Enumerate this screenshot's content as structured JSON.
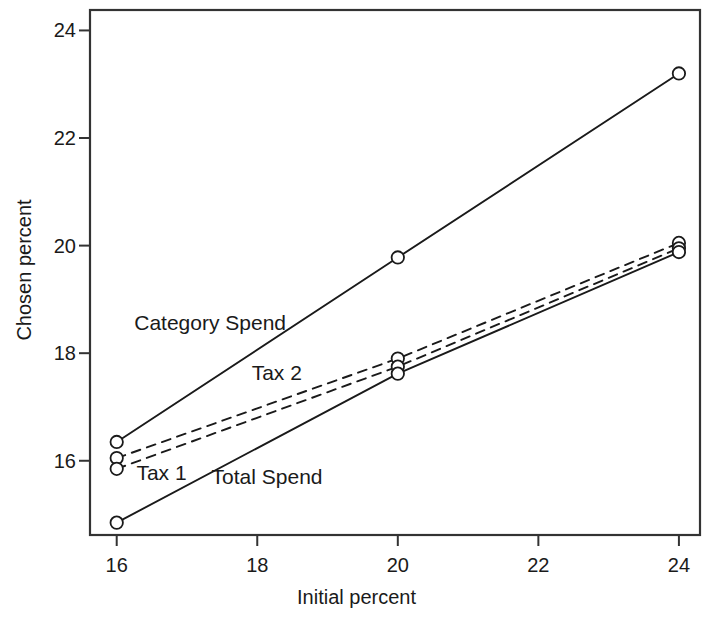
{
  "chart_data": {
    "type": "line",
    "title": "",
    "xlabel": "Initial percent",
    "ylabel": "Chosen percent",
    "x": [
      16,
      20,
      24
    ],
    "xlim": [
      15.62,
      24.3
    ],
    "ylim": [
      14.62,
      24.38
    ],
    "xticks": [
      16,
      18,
      20,
      22,
      24
    ],
    "yticks": [
      16,
      18,
      20,
      22,
      24
    ],
    "xticklabels": [
      "16",
      "18",
      "20",
      "22",
      "24"
    ],
    "yticklabels": [
      "16",
      "18",
      "20",
      "22",
      "24"
    ],
    "grid": false,
    "legend_position": "inline-annotations",
    "marker": "open-circle",
    "series": [
      {
        "name": "Category Spend",
        "values": [
          16.35,
          19.78,
          23.2
        ],
        "linestyle": "solid",
        "color": "#1a1a1a",
        "label_x": 16.25,
        "label_y": 18.55
      },
      {
        "name": "Tax 2",
        "values": [
          16.05,
          17.9,
          20.05
        ],
        "linestyle": "dashed",
        "color": "#1a1a1a",
        "label_x": 17.92,
        "label_y": 17.62
      },
      {
        "name": "Tax 1",
        "values": [
          15.85,
          17.75,
          19.95
        ],
        "linestyle": "dashed",
        "color": "#1a1a1a",
        "label_x": 16.28,
        "label_y": 15.76
      },
      {
        "name": "Total Spend",
        "values": [
          14.85,
          17.62,
          19.88
        ],
        "linestyle": "solid",
        "color": "#1a1a1a",
        "label_x": 17.35,
        "label_y": 15.68
      }
    ]
  },
  "axes": {
    "frame_color": "#333333",
    "background": "#ffffff"
  }
}
